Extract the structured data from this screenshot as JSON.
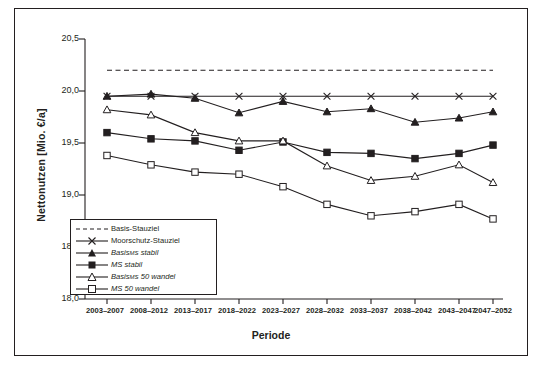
{
  "chart_data": {
    "type": "line",
    "title": "",
    "xlabel": "Periode",
    "ylabel": "Nettonutzen [Mio. €/a]",
    "ylim": [
      18.0,
      20.5
    ],
    "yticks": [
      "18,0",
      "18,5",
      "19,0",
      "19,5",
      "20,0",
      "20,5"
    ],
    "grid": false,
    "legend_position": "inside-lower-left",
    "categories": [
      "2003–2007",
      "2008–2012",
      "2013–2017",
      "2018–2022",
      "2023–2027",
      "2028–2032",
      "2033–2037",
      "2038–2042",
      "2043–2047",
      "2047–2052"
    ],
    "series": [
      {
        "name": "Basis-Stauziel",
        "style": "dashed",
        "marker": "none",
        "values": [
          20.2,
          20.2,
          20.2,
          20.2,
          20.2,
          20.2,
          20.2,
          20.2,
          20.2,
          20.2
        ]
      },
      {
        "name": "Moorschutz-Stauziel",
        "style": "solid",
        "marker": "x",
        "values": [
          19.95,
          19.95,
          19.95,
          19.95,
          19.95,
          19.95,
          19.95,
          19.95,
          19.95,
          19.95
        ]
      },
      {
        "name": "Basis_MS stabil",
        "style": "solid",
        "marker": "triangle-filled",
        "values": [
          19.95,
          19.97,
          19.93,
          19.79,
          19.9,
          19.8,
          19.83,
          19.7,
          19.74,
          19.8
        ]
      },
      {
        "name": "MS stabil",
        "style": "solid",
        "marker": "square-filled",
        "values": [
          19.6,
          19.54,
          19.52,
          19.43,
          19.51,
          19.41,
          19.4,
          19.35,
          19.4,
          19.48
        ]
      },
      {
        "name": "Basis_MS 50 wandel",
        "style": "solid",
        "marker": "triangle-open",
        "values": [
          19.82,
          19.77,
          19.6,
          19.52,
          19.52,
          19.28,
          19.14,
          19.18,
          19.29,
          19.12
        ]
      },
      {
        "name": "MS 50 wandel",
        "style": "solid",
        "marker": "square-open",
        "values": [
          19.38,
          19.29,
          19.22,
          19.2,
          19.08,
          18.91,
          18.8,
          18.84,
          18.91,
          18.77
        ]
      }
    ],
    "legend": [
      {
        "label": "Basis-Stauziel",
        "symbol": "dashed-line"
      },
      {
        "label": "Moorschutz-Stauziel",
        "symbol": "line-x-marker"
      },
      {
        "label_main": "Basis",
        "label_sub": "MS",
        "label_tail": " stabil",
        "symbol": "line-triangle-filled"
      },
      {
        "label_main": "MS",
        "label_sub": "",
        "label_tail": " stabil",
        "symbol": "line-square-filled"
      },
      {
        "label_main": "Basis",
        "label_sub": "MS",
        "label_tail": " 50 wandel",
        "symbol": "line-triangle-open"
      },
      {
        "label_main": "MS",
        "label_sub": "",
        "label_tail": " 50 wandel",
        "symbol": "line-square-open"
      }
    ]
  },
  "colors": {
    "line": "#231f20",
    "background": "#ffffff",
    "frame": "#231f20"
  }
}
